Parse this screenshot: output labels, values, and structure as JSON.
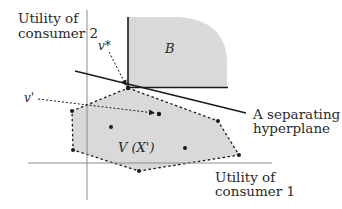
{
  "diagram": {
    "axes": {
      "y_label_line1": "Utility of",
      "y_label_line2": "consumer 2",
      "x_label_line1": "Utility of",
      "x_label_line2": "consumer 1"
    },
    "regions": {
      "upper_set_label": "B",
      "feasible_set_label": "V (X')"
    },
    "points": {
      "optimal_label": "v*",
      "alternative_label": "v'"
    },
    "hyperplane": {
      "label_line1": "A separating",
      "label_line2": "hyperplane"
    },
    "colors": {
      "region_fill": "#d9d9d9",
      "line": "#1a1a1a",
      "axis": "#8c8c8c",
      "text": "#2a2a2a"
    }
  }
}
